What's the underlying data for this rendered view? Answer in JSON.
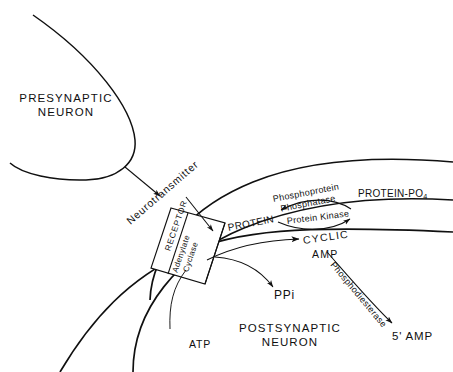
{
  "figure": {
    "type": "diagram",
    "background": "#ffffff",
    "ink": "#101010"
  },
  "cells": {
    "presynaptic": {
      "line1": "PRESYNAPTIC",
      "line2": "NEURON"
    },
    "postsynaptic": {
      "line1": "POSTSYNAPTIC",
      "line2": "NEURON"
    }
  },
  "membrane_proteins": {
    "receptor": "RECEPTOR",
    "cyclase_line1": "Adenylate",
    "cyclase_line2": "Cyclase"
  },
  "molecules": {
    "neurotransmitter": "Neurotransmitter",
    "atp": "ATP",
    "ppi": "PPi",
    "cyclic": "CYCLIC",
    "amp": "AMP",
    "protein": "PROTEIN",
    "protein_po4_text": "PROTEIN-PO",
    "protein_po4_sub": "4",
    "five_prime_amp": "5' AMP"
  },
  "enzymes": {
    "phosphatase_line1": "Phosphoprotein",
    "phosphatase_line2": "Phosphatase",
    "kinase": "Protein  Kinase",
    "phosphodiesterase": "Phosphodiesterase"
  }
}
